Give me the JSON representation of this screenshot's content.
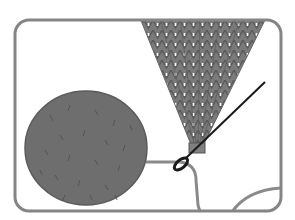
{
  "illustration": {
    "subject": "Attaching a pom-pom to knitted hat tip with a needle",
    "colors": {
      "frame": "#858585",
      "pompom": "#6e6e6e",
      "pompom_fiber": "#4e4e4e",
      "knit": "#7a7a7a",
      "knit_dark": "#555555",
      "yarn": "#8a8a8a",
      "needle": "#1a1a1a",
      "background": "#ffffff"
    },
    "frame": {
      "x": 15,
      "y": 20,
      "width": 266,
      "height": 191,
      "radius": 14,
      "stroke": 3
    },
    "pompom": {
      "cx": 86,
      "cy": 148,
      "rx": 61,
      "ry": 57
    },
    "knit_cone": {
      "top_left_x": 140,
      "top_right_x": 265,
      "top_y": 20,
      "tip_x": 197,
      "tip_y": 152
    },
    "needle": {
      "x1": 265,
      "y1": 82,
      "x2": 176,
      "y2": 168
    }
  }
}
